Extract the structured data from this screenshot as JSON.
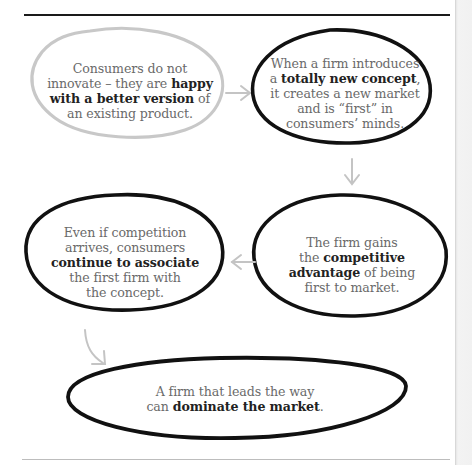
{
  "diagram": {
    "type": "flow",
    "nodes": [
      {
        "id": "n1",
        "style": "gray-outline",
        "parts": [
          {
            "t": "Consumers do not innovate – they are ",
            "b": false
          },
          {
            "t": "happy with a better version",
            "b": true
          },
          {
            "t": " of an existing product.",
            "b": false
          }
        ],
        "lines": [
          "Consumers do not",
          "innovate – they are ",
          "happy",
          "with a better version",
          " of",
          "an existing product."
        ]
      },
      {
        "id": "n2",
        "style": "black-outline",
        "lines": [
          "When a firm introduces",
          "a ",
          "totally new concept",
          ",",
          "it creates a new market",
          "and is “first” in",
          "consumers’ minds."
        ]
      },
      {
        "id": "n3",
        "style": "black-outline",
        "lines": [
          "The firm gains",
          "the ",
          "competitive",
          "advantage",
          " of being",
          "first to market."
        ]
      },
      {
        "id": "n4",
        "style": "black-outline",
        "lines": [
          "Even if competition",
          "arrives, consumers",
          "continue to associate",
          "the first firm with",
          "the concept."
        ]
      },
      {
        "id": "n5",
        "style": "black-outline",
        "lines": [
          "A firm that leads the way",
          "can ",
          "dominate the market",
          "."
        ]
      }
    ],
    "edges": [
      {
        "from": "n1",
        "to": "n2",
        "direction": "right"
      },
      {
        "from": "n2",
        "to": "n3",
        "direction": "down"
      },
      {
        "from": "n3",
        "to": "n4",
        "direction": "left"
      },
      {
        "from": "n4",
        "to": "n5",
        "direction": "down-curve"
      }
    ],
    "colors": {
      "outline_dark": "#111111",
      "outline_light": "#c8c8c8",
      "arrow": "#c4c4c4",
      "body_text": "#6a6a6a",
      "bold_text": "#222222"
    }
  }
}
